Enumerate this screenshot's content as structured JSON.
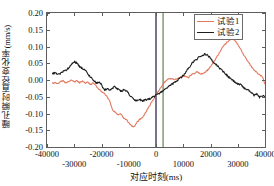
{
  "chart_data": {
    "type": "line",
    "title": "",
    "xlabel": "对应时刻(ms)",
    "ylabel": "瞳孔瞬时直径变化率(mm/s)",
    "xlim": [
      -40000,
      40000
    ],
    "ylim": [
      -0.2,
      0.2
    ],
    "xticks": [
      -40000,
      -30000,
      -20000,
      -10000,
      0,
      10000,
      20000,
      30000,
      40000
    ],
    "xticklabels": [
      "-40000",
      "-30000",
      "-20000",
      "-10000",
      "0",
      "10000",
      "20000",
      "30000",
      "40000"
    ],
    "yticks": [
      0.2,
      0.15,
      0.1,
      0.05,
      0.0,
      -0.05,
      -0.1,
      -0.15,
      -0.2
    ],
    "yticklabels": [
      "0.20",
      "0.15",
      "0.10",
      "0.05",
      "0.00",
      "-0.05",
      "-0.10",
      "-0.15",
      "-0.20"
    ],
    "grid": false,
    "legend_position": "top-right",
    "legend": [
      "试验1",
      "试验2"
    ],
    "colors": {
      "series1": "#E2795F",
      "series2": "#1d1d1d",
      "marker_black": "#2b2b50",
      "marker_green": "#6f8f5a",
      "axis": "#5d5d5d"
    },
    "vertical_markers": [
      {
        "name": "black-marker-line",
        "x": 0,
        "color": "#2b2b50"
      },
      {
        "name": "green-marker-line",
        "x": 2600,
        "color": "#6f8f5a"
      }
    ],
    "series": [
      {
        "name": "试验1",
        "color": "#E2795F",
        "x": [
          -38000,
          -37000,
          -36000,
          -35000,
          -34000,
          -33000,
          -32000,
          -31000,
          -30000,
          -29000,
          -28000,
          -27000,
          -26000,
          -25000,
          -24000,
          -23000,
          -22000,
          -21000,
          -20000,
          -19000,
          -18000,
          -17000,
          -16500,
          -16000,
          -15000,
          -14000,
          -13000,
          -12000,
          -11000,
          -10000,
          -9000,
          -8000,
          -7000,
          -6000,
          -5000,
          -4000,
          -3000,
          -2000,
          -1000,
          0,
          1000,
          2000,
          3000,
          4000,
          5000,
          6000,
          7000,
          8000,
          9000,
          10000,
          11000,
          12000,
          13000,
          14000,
          15000,
          16000,
          17000,
          18000,
          19000,
          20000,
          21000,
          22000,
          23000,
          24000,
          25000,
          26000,
          27000,
          28000,
          29000,
          30000,
          31000,
          32000,
          33000,
          34000,
          35000,
          36000,
          37000,
          38000,
          39000,
          40000
        ],
        "y": [
          -0.01,
          -0.008,
          -0.012,
          -0.005,
          -0.002,
          -0.01,
          -0.004,
          0.0,
          -0.006,
          -0.002,
          -0.008,
          -0.004,
          -0.01,
          -0.005,
          -0.014,
          -0.008,
          -0.018,
          -0.026,
          -0.034,
          -0.04,
          -0.05,
          -0.062,
          -0.075,
          -0.088,
          -0.096,
          -0.104,
          -0.1,
          -0.112,
          -0.118,
          -0.127,
          -0.138,
          -0.14,
          -0.126,
          -0.118,
          -0.112,
          -0.1,
          -0.086,
          -0.072,
          -0.058,
          -0.044,
          -0.032,
          -0.02,
          -0.008,
          0.0,
          0.004,
          0.003,
          0.002,
          0.004,
          0.008,
          0.012,
          0.01,
          0.008,
          0.016,
          0.02,
          0.024,
          0.02,
          0.018,
          0.022,
          0.03,
          0.04,
          0.052,
          0.064,
          0.078,
          0.092,
          0.104,
          0.112,
          0.12,
          0.124,
          0.118,
          0.106,
          0.092,
          0.078,
          0.064,
          0.052,
          0.04,
          0.03,
          0.022,
          0.016,
          0.01,
          -0.012
        ],
        "notes": "Approximate; see path sampled at plotted resolution"
      },
      {
        "name": "试验2",
        "color": "#1d1d1d",
        "x": [
          -38000,
          -37000,
          -36000,
          -35000,
          -34000,
          -33000,
          -32000,
          -31000,
          -30000,
          -29000,
          -28000,
          -27000,
          -26000,
          -25000,
          -24000,
          -23000,
          -22000,
          -21000,
          -20000,
          -19000,
          -18000,
          -17000,
          -16000,
          -15000,
          -14000,
          -13000,
          -12000,
          -11000,
          -10000,
          -9000,
          -8000,
          -7000,
          -6000,
          -5000,
          -4000,
          -3000,
          -2000,
          -1000,
          0,
          1000,
          2000,
          3000,
          4000,
          5000,
          6000,
          7000,
          8000,
          9000,
          10000,
          11000,
          12000,
          13000,
          14000,
          15000,
          16000,
          17000,
          18000,
          19000,
          20000,
          21000,
          22000,
          23000,
          24000,
          25000,
          26000,
          27000,
          28000,
          29000,
          30000,
          31000,
          32000,
          33000,
          34000,
          35000,
          36000,
          37000,
          38000,
          39000,
          40000
        ],
        "y": [
          0.018,
          0.022,
          0.016,
          0.02,
          0.026,
          0.03,
          0.036,
          0.046,
          0.055,
          0.05,
          0.04,
          0.035,
          0.03,
          0.018,
          0.008,
          0.0,
          -0.01,
          -0.006,
          -0.014,
          -0.03,
          -0.026,
          -0.03,
          -0.024,
          -0.02,
          -0.028,
          -0.034,
          -0.03,
          -0.032,
          -0.04,
          -0.052,
          -0.06,
          -0.062,
          -0.058,
          -0.062,
          -0.06,
          -0.058,
          -0.056,
          -0.05,
          -0.046,
          -0.04,
          -0.036,
          -0.03,
          -0.024,
          -0.018,
          -0.012,
          -0.006,
          0.0,
          0.006,
          0.014,
          0.024,
          0.036,
          0.048,
          0.058,
          0.062,
          0.07,
          0.074,
          0.078,
          0.074,
          0.064,
          0.054,
          0.046,
          0.038,
          0.03,
          0.022,
          0.014,
          0.006,
          0.0,
          -0.006,
          -0.012,
          -0.014,
          -0.022,
          -0.028,
          -0.03,
          -0.038,
          -0.046,
          -0.042,
          -0.052,
          -0.048,
          -0.05
        ],
        "notes": "Approximate; see path sampled at plotted resolution"
      }
    ]
  }
}
